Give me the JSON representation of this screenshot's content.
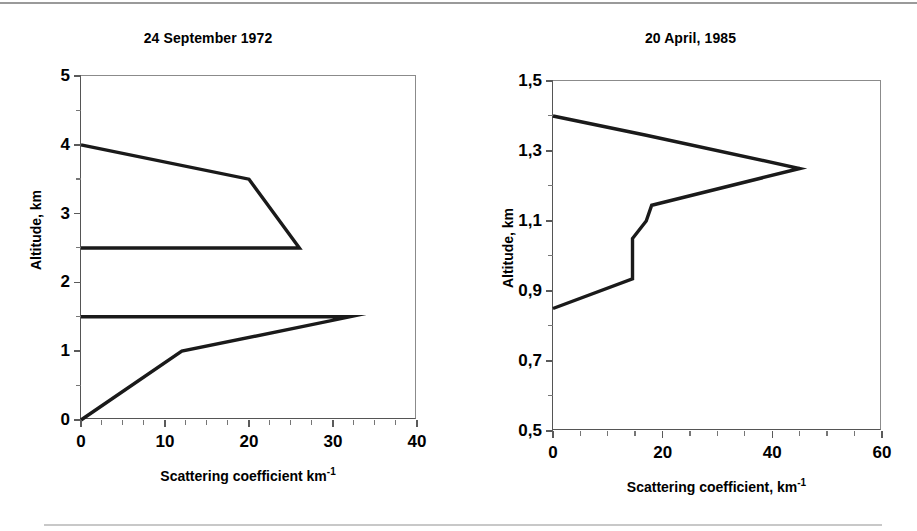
{
  "figure": {
    "background": "#ffffff",
    "line_color": "#1a1a1a",
    "axis_color": "#5a5a5a"
  },
  "axis_titles": {
    "altitude": "Altitude, km",
    "scattering_plain": "Scattering coefficient km",
    "scattering_comma": "Scattering coefficient, km",
    "exponent": "-1"
  },
  "chart_data": [
    {
      "type": "line",
      "title": "24 September 1972",
      "xlabel": "Scattering coefficient km-1",
      "ylabel": "Altitude, km",
      "xlim": [
        0,
        40
      ],
      "ylim": [
        0,
        5
      ],
      "xticks": [
        0,
        10,
        20,
        30,
        40
      ],
      "xticklabels": [
        "0",
        "10",
        "20",
        "30",
        "40"
      ],
      "xminor_step": 2.5,
      "yticks": [
        0,
        1,
        2,
        3,
        4,
        5
      ],
      "yticklabels": [
        "0",
        "1",
        "2",
        "3",
        "4",
        "5"
      ],
      "yminor_step": 0.5,
      "grid": false,
      "legend": "none",
      "series": [
        {
          "name": "upper layer",
          "x": [
            0,
            20,
            26,
            0
          ],
          "y": [
            4.0,
            3.5,
            2.5,
            2.5
          ]
        },
        {
          "name": "lower layer",
          "x": [
            0,
            12,
            32,
            0
          ],
          "y": [
            0.0,
            1.0,
            1.5,
            1.5
          ]
        }
      ]
    },
    {
      "type": "line",
      "title": "20 April, 1985",
      "xlabel": "Scattering coefficient, km-1",
      "ylabel": "Altitude, km",
      "xlim": [
        0,
        60
      ],
      "ylim": [
        0.5,
        1.5
      ],
      "xticks": [
        0,
        20,
        40,
        60
      ],
      "xticklabels": [
        "0",
        "20",
        "40",
        "60"
      ],
      "xminor_step": 5,
      "yticks": [
        0.5,
        0.7,
        0.9,
        1.1,
        1.3,
        1.5
      ],
      "yticklabels": [
        "0,5",
        "0,7",
        "0,9",
        "1,1",
        "1,3",
        "1,5"
      ],
      "yminor_step": 0.1,
      "grid": false,
      "legend": "none",
      "series": [
        {
          "name": "aerosol profile",
          "x": [
            0,
            17,
            45,
            18,
            17,
            14.5,
            14.5,
            0
          ],
          "y": [
            1.4,
            1.345,
            1.25,
            1.145,
            1.1,
            1.05,
            0.935,
            0.85
          ]
        }
      ]
    }
  ]
}
